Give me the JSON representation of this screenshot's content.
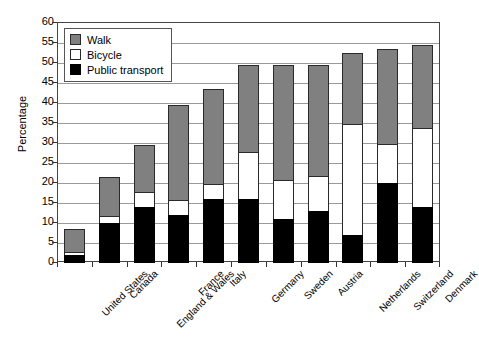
{
  "chart_data": {
    "type": "bar",
    "subtype": "stacked-vertical",
    "title": "",
    "subtitle": "",
    "xlabel": "",
    "ylabel": "Percentage",
    "ylim": [
      0,
      60
    ],
    "yticks": [
      0,
      5,
      10,
      15,
      20,
      25,
      30,
      35,
      40,
      45,
      50,
      55,
      60
    ],
    "grid": true,
    "legend_position": "top-left",
    "categories": [
      "United States",
      "Canada",
      "England & Wales",
      "France",
      "Italy",
      "Germany",
      "Sweden",
      "Austria",
      "Netherlands",
      "Switzerland",
      "Denmark"
    ],
    "series": [
      {
        "name": "Public transport",
        "color": "#000000",
        "values": [
          2,
          10,
          14,
          12,
          16,
          16,
          11,
          13,
          7,
          20,
          14
        ]
      },
      {
        "name": "Bicycle",
        "color": "#ffffff",
        "values": [
          1,
          2,
          4,
          4,
          4,
          12,
          10,
          9,
          28,
          10,
          20
        ]
      },
      {
        "name": "Walk",
        "color": "#808080",
        "values": [
          6,
          10,
          12,
          24,
          24,
          22,
          29,
          28,
          18,
          24,
          21
        ]
      }
    ],
    "totals": [
      9,
      22,
      30,
      40,
      44,
      50,
      50,
      50,
      53,
      54,
      55
    ]
  },
  "legend": {
    "items": [
      {
        "label": "Walk",
        "swatch": "walk"
      },
      {
        "label": "Bicycle",
        "swatch": "bicycle"
      },
      {
        "label": "Public transport",
        "swatch": "public"
      }
    ]
  }
}
